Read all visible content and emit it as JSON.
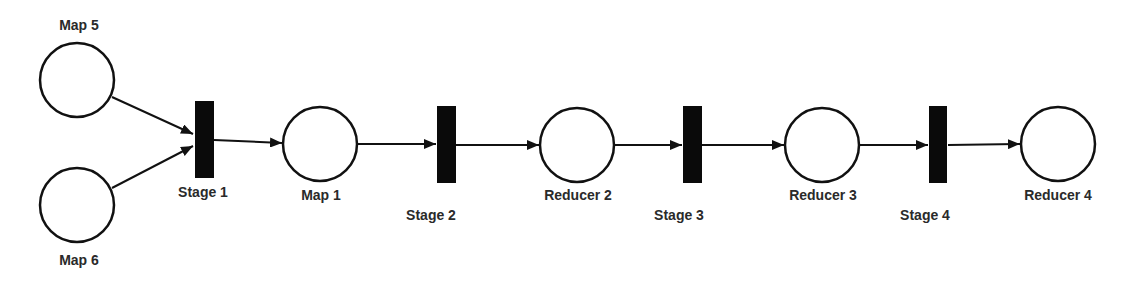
{
  "diagram": {
    "type": "petri-net",
    "colors": {
      "stroke": "#111111",
      "bar": "#0a0a0a",
      "fill": "#ffffff",
      "text": "#2a2a2a"
    },
    "places": [
      {
        "id": "map5",
        "label": "Map 5",
        "cx": 77,
        "cy": 80
      },
      {
        "id": "map6",
        "label": "Map 6",
        "cx": 77,
        "cy": 205
      },
      {
        "id": "map1",
        "label": "Map 1",
        "cx": 320,
        "cy": 144
      },
      {
        "id": "reducer2",
        "label": "Reducer 2",
        "cx": 577,
        "cy": 145
      },
      {
        "id": "reducer3",
        "label": "Reducer 3",
        "cx": 822,
        "cy": 145
      },
      {
        "id": "reducer4",
        "label": "Reducer 4",
        "cx": 1058,
        "cy": 144
      }
    ],
    "transitions": [
      {
        "id": "stage1",
        "label": "Stage 1"
      },
      {
        "id": "stage2",
        "label": "Stage 2"
      },
      {
        "id": "stage3",
        "label": "Stage 3"
      },
      {
        "id": "stage4",
        "label": "Stage 4"
      }
    ],
    "arcs": [
      {
        "from": "map5",
        "to": "stage1"
      },
      {
        "from": "map6",
        "to": "stage1"
      },
      {
        "from": "stage1",
        "to": "map1"
      },
      {
        "from": "map1",
        "to": "stage2"
      },
      {
        "from": "stage2",
        "to": "reducer2"
      },
      {
        "from": "reducer2",
        "to": "stage3"
      },
      {
        "from": "stage3",
        "to": "reducer3"
      },
      {
        "from": "reducer3",
        "to": "stage4"
      },
      {
        "from": "stage4",
        "to": "reducer4"
      }
    ]
  }
}
